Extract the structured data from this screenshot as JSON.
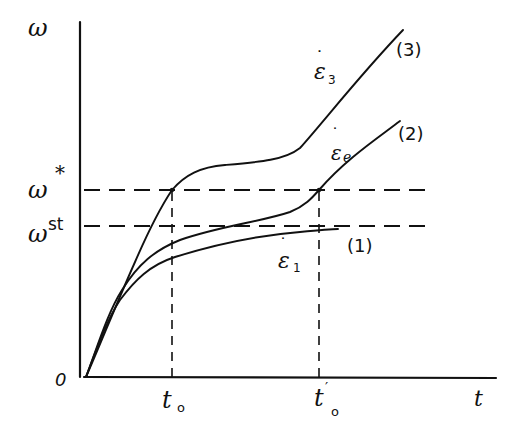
{
  "diagram": {
    "type": "hand-drawn schematic plot",
    "axes": {
      "y_label": "ω",
      "x_label": "t",
      "origin_label": "0"
    },
    "x_ticks": [
      {
        "id": "t0",
        "label": "t",
        "subscript": "o",
        "prime": ""
      },
      {
        "id": "t0prime",
        "label": "t",
        "subscript": "o",
        "prime": "′"
      }
    ],
    "y_levels": [
      {
        "id": "omega_star",
        "label": "ω",
        "superscript": "*"
      },
      {
        "id": "omega_st",
        "label": "ω",
        "superscript": "st"
      }
    ],
    "curves": [
      {
        "id": "curve1",
        "tag": "(1)",
        "rate_label": "ε",
        "rate_subscript": "1",
        "description": "saturates below ω^st"
      },
      {
        "id": "curve2",
        "tag": "(2)",
        "rate_label": "ε",
        "rate_subscript": "e",
        "description": "reaches ω* at t0′ then rises"
      },
      {
        "id": "curve3",
        "tag": "(3)",
        "rate_label": "ε",
        "rate_subscript": "3",
        "description": "reaches ω* at t0, plateau, then rises"
      }
    ],
    "dot_symbol": "˙"
  }
}
